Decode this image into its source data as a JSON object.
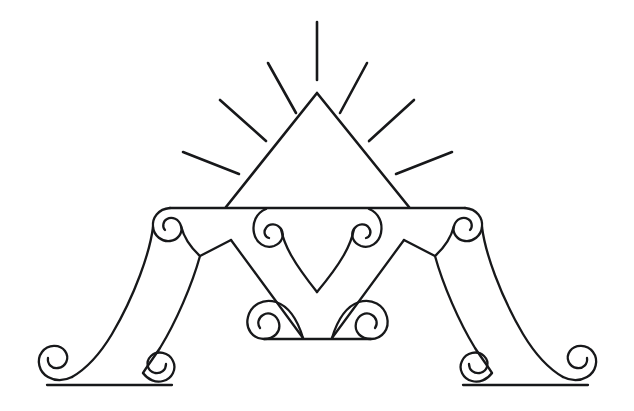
{
  "artwork": {
    "title": "Ornamental Letter A Monogram",
    "subject": "decorative letter A with radiant pyramid and scrollwork",
    "background_color": "#ffffff",
    "ink_color": "#17181a",
    "canvas": {
      "width": 634,
      "height": 411
    },
    "style": "line-art, black outline, no fill"
  },
  "elements": {
    "rays": {
      "label": "radiating sun rays",
      "count": 7,
      "origin": {
        "x": 317,
        "y": 93
      },
      "lines": [
        {
          "name": "ray-center-vertical",
          "x1": 317,
          "y1": 22,
          "x2": 317,
          "y2": 80
        },
        {
          "name": "ray-upper-left",
          "x1": 268,
          "y1": 63,
          "x2": 296,
          "y2": 113
        },
        {
          "name": "ray-upper-right",
          "x1": 367,
          "y1": 63,
          "x2": 340,
          "y2": 113
        },
        {
          "name": "ray-mid-left",
          "x1": 220,
          "y1": 100,
          "x2": 266,
          "y2": 141
        },
        {
          "name": "ray-mid-right",
          "x1": 414,
          "y1": 100,
          "x2": 369,
          "y2": 141
        },
        {
          "name": "ray-lower-left",
          "x1": 183,
          "y1": 152,
          "x2": 239,
          "y2": 174
        },
        {
          "name": "ray-lower-right",
          "x1": 452,
          "y1": 152,
          "x2": 396,
          "y2": 174
        }
      ]
    },
    "pyramid": {
      "label": "triangle pyramid above crossbar",
      "apex": {
        "x": 317,
        "y": 93
      },
      "base_left": {
        "x": 226,
        "y": 207
      },
      "base_right": {
        "x": 409,
        "y": 207
      }
    },
    "crossbar": {
      "label": "horizontal crossbar of the letter A",
      "y": 207,
      "x_start": 168,
      "x_end": 467
    },
    "crossbar_scrolls": {
      "label": "four spiral scrolls hanging from the crossbar",
      "count": 4,
      "centers": [
        {
          "name": "scroll-bar-far-left",
          "x": 180,
          "y": 220
        },
        {
          "name": "scroll-bar-inner-left",
          "x": 288,
          "y": 220
        },
        {
          "name": "scroll-bar-inner-right",
          "x": 347,
          "y": 220
        },
        {
          "name": "scroll-bar-far-right",
          "x": 455,
          "y": 220
        }
      ]
    },
    "heart": {
      "label": "inner heart formed by the two central scrolls",
      "tip": {
        "x": 317,
        "y": 292
      },
      "lobe_left": {
        "x": 288,
        "y": 220
      },
      "lobe_right": {
        "x": 347,
        "y": 220
      }
    },
    "inner_v": {
      "label": "inner V counter of the letter A",
      "apex_left": {
        "x": 231,
        "y": 240
      },
      "apex_right": {
        "x": 404,
        "y": 240
      },
      "valley": {
        "x": 317,
        "y": 315
      }
    },
    "base_scrolls": {
      "label": "central base flourish with paired scrolls",
      "baseline_y": 330,
      "centers": [
        {
          "name": "scroll-center-left",
          "x": 272,
          "y": 318
        },
        {
          "name": "scroll-center-right",
          "x": 364,
          "y": 318
        }
      ]
    },
    "left_foot": {
      "label": "bottom left foot with two opposed scrolls",
      "baseline_y": 385,
      "x_start": 38,
      "x_end": 178,
      "scrolls": [
        {
          "name": "scroll-foot-left-outer",
          "x": 58,
          "y": 368
        },
        {
          "name": "scroll-foot-left-inner",
          "x": 155,
          "y": 368
        }
      ]
    },
    "right_foot": {
      "label": "bottom right foot with two opposed scrolls",
      "baseline_y": 385,
      "x_start": 456,
      "x_end": 597,
      "scrolls": [
        {
          "name": "scroll-foot-right-inner",
          "x": 478,
          "y": 368
        },
        {
          "name": "scroll-foot-right-outer",
          "x": 576,
          "y": 368
        }
      ]
    },
    "legs": {
      "label": "the two diagonal legs of the letter A",
      "left": {
        "top_x": 196,
        "top_y": 214,
        "bottom_x": 92,
        "bottom_y": 385
      },
      "right": {
        "top_x": 440,
        "top_y": 214,
        "bottom_x": 543,
        "bottom_y": 385
      }
    }
  }
}
